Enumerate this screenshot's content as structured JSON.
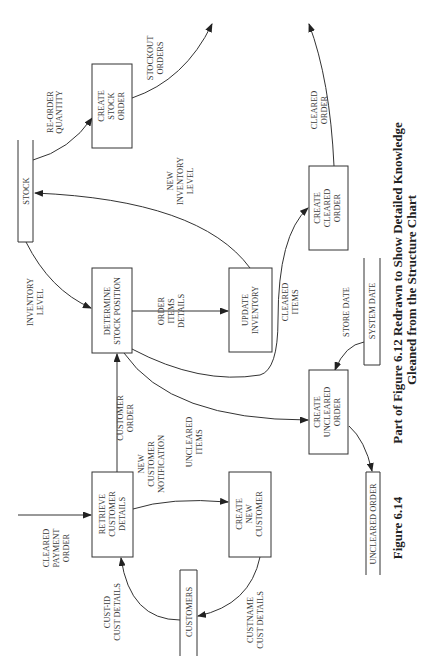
{
  "header_fragment": "",
  "processes": {
    "create_stock_order": [
      "CREATE",
      "STOCK",
      "ORDER"
    ],
    "determine_stock_position": [
      "DETERMINE",
      "STOCK POSITION"
    ],
    "update_inventory": [
      "UPDATE",
      "INVENTORY"
    ],
    "create_cleared_order": [
      "CREATE",
      "CLEARED",
      "ORDER"
    ],
    "create_uncleared_order": [
      "CREATE",
      "UNCLEARED",
      "ORDER"
    ],
    "retrieve_customer_details": [
      "RETRIEVE",
      "CUSTOMER",
      "DETAILS"
    ],
    "create_new_customer": [
      "CREATE",
      "NEW",
      "CUSTOMER"
    ]
  },
  "data_stores": {
    "stock": "STOCK",
    "system_date": "SYSTEM DATE",
    "uncleared_order": "UNCLEARED ORDER",
    "customers": "CUSTOMERS"
  },
  "flows": {
    "re_order_quantity": [
      "RE-ORDER",
      "QUANTITY"
    ],
    "stockout_orders": [
      "STOCKOUT",
      "ORDERS"
    ],
    "new_inventory_level": [
      "NEW",
      "INVENTORY",
      "LEVEL"
    ],
    "cleared_order": [
      "CLEARED",
      "ORDER"
    ],
    "inventory_level": [
      "INVENTORY",
      "LEVEL"
    ],
    "order_items_details": [
      "ORDER",
      "ITEMS",
      "DETAILS"
    ],
    "cleared_items": [
      "CLEARED",
      "ITEMS"
    ],
    "store_date": "STORE DATE",
    "customer_order": [
      "CUSTOMER",
      "ORDER"
    ],
    "new_customer_notification": [
      "NEW",
      "CUSTOMER",
      "NOTIFICATION"
    ],
    "uncleared_items": [
      "UNCLEARED",
      "ITEMS"
    ],
    "cleared_payment_order": [
      "CLEARED",
      "PAYMENT",
      "ORDER"
    ],
    "cust_id_cust_details": [
      "CUST-ID",
      "CUST DETAILS"
    ],
    "custname_cust_details": [
      "CUSTNAME",
      "CUST DETAILS"
    ]
  },
  "caption": {
    "figure_number": "Figure 6.14",
    "title_line1": "Part of Figure 6.12 Redrawn to Show Detailed Knowledge",
    "title_line2": "Gleaned from the Structure Chart"
  }
}
